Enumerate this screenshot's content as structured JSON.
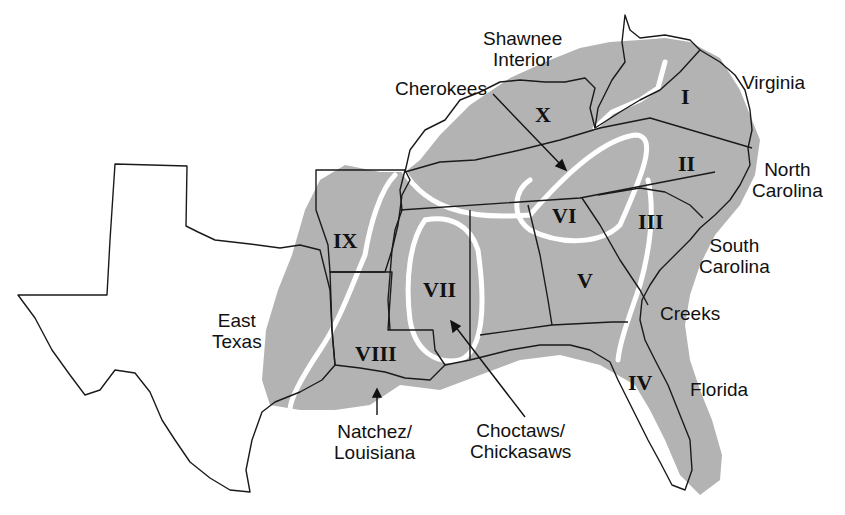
{
  "map": {
    "title": "Southeastern United States culture regions",
    "colors": {
      "region_fill": "#b3b3b3",
      "boundary": "#ffffff",
      "state_line": "#1a1a1a",
      "background": "#ffffff"
    },
    "regions": [
      {
        "numeral": "I"
      },
      {
        "numeral": "II"
      },
      {
        "numeral": "III"
      },
      {
        "numeral": "IV"
      },
      {
        "numeral": "V"
      },
      {
        "numeral": "VI"
      },
      {
        "numeral": "VII"
      },
      {
        "numeral": "VIII"
      },
      {
        "numeral": "IX"
      },
      {
        "numeral": "X"
      }
    ],
    "labels": {
      "shawnee": [
        "Shawnee",
        "Interior"
      ],
      "cherokees": "Cherokees",
      "virginia": "Virginia",
      "north_carolina": [
        "North",
        "Carolina"
      ],
      "south_carolina": [
        "South",
        "Carolina"
      ],
      "creeks": "Creeks",
      "florida": "Florida",
      "east_texas": [
        "East",
        "Texas"
      ],
      "natchez": [
        "Natchez/",
        "Louisiana"
      ],
      "choctaws": [
        "Choctaws/",
        "Chickasaws"
      ]
    }
  }
}
